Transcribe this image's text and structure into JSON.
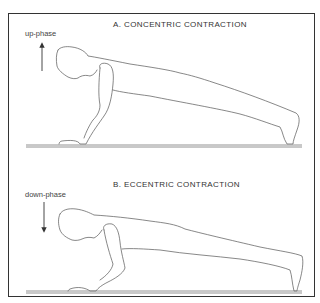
{
  "figure": {
    "panel_a": {
      "title": "A.  CONCENTRIC CONTRACTION",
      "phase_label": "up-phase",
      "arrow_direction": "up"
    },
    "panel_b": {
      "title": "B.  ECCENTRIC CONTRACTION",
      "phase_label": "down-phase",
      "arrow_direction": "down"
    }
  }
}
